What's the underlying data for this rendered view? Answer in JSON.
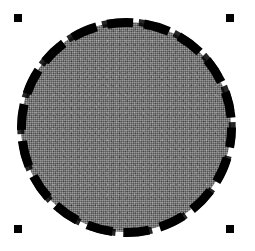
{
  "canvas": {
    "width": 255,
    "height": 251,
    "background_color": "#ffffff",
    "label": "drawing-canvas"
  },
  "shape": {
    "type": "circle",
    "name": "Circle",
    "selected": true,
    "center_x": 126,
    "center_y": 127,
    "diameter": 210,
    "fill": {
      "style": "dithered-gray",
      "color": "#7c7c7c",
      "pattern": "halftone-noise"
    },
    "outline": {
      "style": "dashed",
      "color": "#000000",
      "width": 9,
      "dash_length": 26,
      "gap_length": 11
    }
  },
  "selection": {
    "visible": true,
    "handle_color": "#000000",
    "handle_size": 8,
    "handles": [
      {
        "id": "top-left",
        "x": 18,
        "y": 18
      },
      {
        "id": "top-right",
        "x": 230,
        "y": 18
      },
      {
        "id": "bottom-left",
        "x": 18,
        "y": 229
      },
      {
        "id": "bottom-right",
        "x": 230,
        "y": 229
      }
    ]
  }
}
